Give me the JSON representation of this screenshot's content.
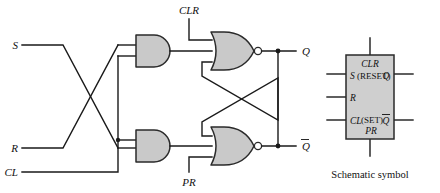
{
  "figure": {
    "kind": "logic-circuit-diagram",
    "caption": "Schematic symbol",
    "colors": {
      "background": "#ffffff",
      "wire": "#1a1a1a",
      "gate_fill": "#c9c9c9",
      "gate_stroke": "#2a2a2a",
      "symbol_fill": "#cfcfcf",
      "bubble_fill": "#ffffff"
    }
  },
  "circuit": {
    "inputs": [
      {
        "id": "S",
        "label": "S"
      },
      {
        "id": "R",
        "label": "R"
      },
      {
        "id": "CL",
        "label": "CL"
      },
      {
        "id": "CLR",
        "label": "CLR"
      },
      {
        "id": "PR",
        "label": "PR"
      }
    ],
    "outputs": [
      {
        "id": "Q",
        "label": "Q",
        "overline": false
      },
      {
        "id": "Qbar",
        "label": "Q",
        "overline": true
      }
    ],
    "gates": [
      {
        "id": "and-top",
        "type": "AND",
        "inputs": [
          "R",
          "CL"
        ],
        "output": "and-top-out"
      },
      {
        "id": "and-bottom",
        "type": "AND",
        "inputs": [
          "S",
          "CL"
        ],
        "output": "and-bottom-out"
      },
      {
        "id": "nor-top",
        "type": "NOR",
        "inputs": [
          "CLR",
          "and-top-out",
          "Qbar"
        ],
        "output": "Q"
      },
      {
        "id": "nor-bottom",
        "type": "NOR",
        "inputs": [
          "and-bottom-out",
          "PR",
          "Q"
        ],
        "output": "Qbar"
      }
    ]
  },
  "symbol": {
    "title_top": "CLR",
    "left_pins": [
      {
        "label": "S",
        "note": "(RESET)"
      },
      {
        "label": "R",
        "note": ""
      },
      {
        "label": "CL",
        "note": "(SET)"
      }
    ],
    "bottom_label": "PR",
    "right_pins": [
      {
        "label": "Q",
        "overline": false
      },
      {
        "label": "Q",
        "overline": true
      }
    ],
    "caption": "Schematic symbol"
  }
}
